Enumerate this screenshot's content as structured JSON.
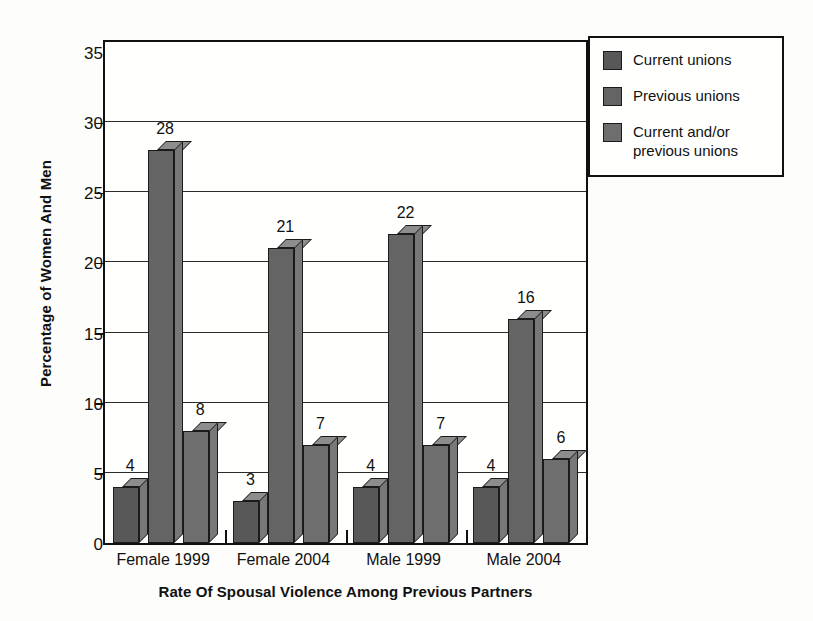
{
  "chart_data": {
    "type": "bar",
    "title": "",
    "xlabel": "Rate Of Spousal Violence Among Previous Partners",
    "ylabel": "Percentage of Women And Men",
    "categories": [
      "Female 1999",
      "Female 2004",
      "Male 1999",
      "Male 2004"
    ],
    "series": [
      {
        "name": "Current unions",
        "values": [
          4,
          3,
          4,
          4
        ],
        "color": "#585858"
      },
      {
        "name": "Previous unions",
        "values": [
          28,
          21,
          22,
          16
        ],
        "color": "#646464"
      },
      {
        "name": "Current and/or previous unions",
        "values": [
          8,
          7,
          7,
          6
        ],
        "color": "#6e6e6e"
      }
    ],
    "ylim": [
      0,
      35
    ],
    "yticks": [
      0,
      5,
      10,
      15,
      20,
      25,
      30,
      35
    ],
    "ytick_labels": [
      "0",
      "5",
      "10",
      "15",
      "20",
      "25",
      "30",
      "35"
    ],
    "grid": true,
    "legend_position": "right",
    "legend": [
      {
        "label": "Current unions"
      },
      {
        "label": "Previous unions"
      },
      {
        "label": "Current and/or\nprevious unions"
      }
    ],
    "data_labels": [
      {
        "category": "Female 1999",
        "values": [
          "4",
          "28",
          "8"
        ]
      },
      {
        "category": "Female 2004",
        "values": [
          "3",
          "21",
          "7"
        ]
      },
      {
        "category": "Male 1999",
        "values": [
          "4",
          "22",
          "7"
        ]
      },
      {
        "category": "Male 2004",
        "values": [
          "4",
          "16",
          "6"
        ]
      }
    ]
  }
}
